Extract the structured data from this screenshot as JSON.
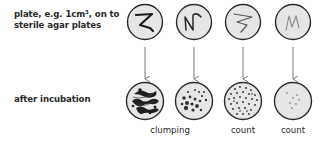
{
  "labels": {
    "plate_line1": "plate, e.g. 1cm³, on to",
    "plate_line2": "sterile agar plates",
    "after": "after incubation"
  },
  "captions": {
    "clumping": "clumping",
    "count1": "count",
    "count2": "count"
  },
  "plates": [
    {
      "id": "plate-1",
      "streak": "dense",
      "result": "clumping"
    },
    {
      "id": "plate-2",
      "streak": "medium",
      "result": "clumping"
    },
    {
      "id": "plate-3",
      "streak": "light",
      "result": "count"
    },
    {
      "id": "plate-4",
      "streak": "faint",
      "result": "count"
    }
  ],
  "colors": {
    "plate_fill": "#e6e6e6",
    "plate_stroke": "#2b2b2b",
    "arrow": "#7a7a7a"
  }
}
